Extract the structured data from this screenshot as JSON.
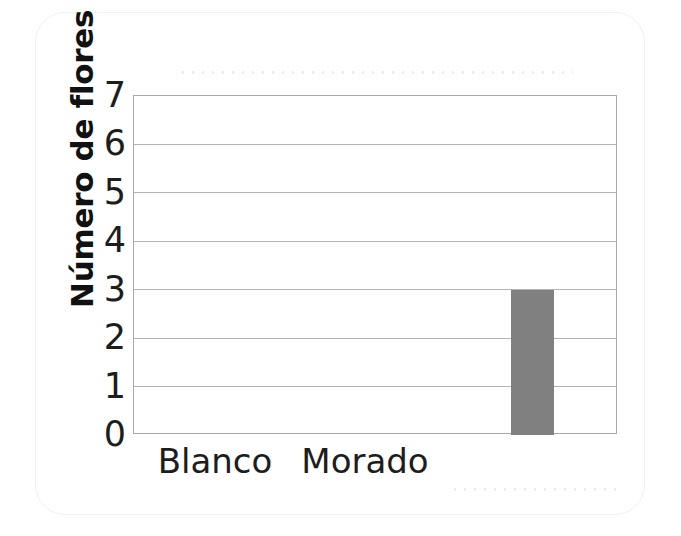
{
  "chart_data": {
    "type": "bar",
    "title": "",
    "subtitle": "",
    "xlabel": "",
    "ylabel": "Número de flores",
    "categories": [
      "Blanco",
      "Morado"
    ],
    "values": [
      0,
      3
    ],
    "series": [
      {
        "name": "Número de flores",
        "values": [
          0,
          3
        ],
        "color": "#808080"
      }
    ],
    "ylim": [
      0,
      7
    ],
    "yticks": [
      "0",
      "1",
      "2",
      "3",
      "4",
      "5",
      "6",
      "7"
    ],
    "grid": "horizontal",
    "legend": "none",
    "bar_color": "#808080",
    "axis_color": "#a8a8a8",
    "gridline_color": "#b4b4b4",
    "annotations": []
  },
  "axes": {
    "y_label": "Número de flores",
    "y_tick_labels": [
      "0",
      "1",
      "2",
      "3",
      "4",
      "5",
      "6",
      "7"
    ],
    "x_tick_labels": [
      "Blanco",
      "Morado"
    ]
  },
  "page": {
    "background": "#ffffff",
    "card_border": "#f1f1f1"
  }
}
